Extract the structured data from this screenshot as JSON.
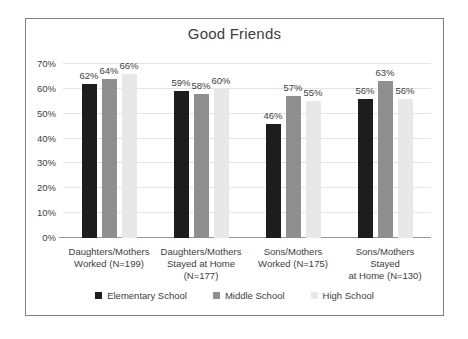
{
  "chart_data": {
    "type": "bar",
    "title": "Good Friends",
    "categories": [
      "Daughters/Mothers Worked (N=199)",
      "Daughters/Mothers Stayed at Home (N=177)",
      "Sons/Mothers Worked (N=175)",
      "Sons/Mothers Stayed at Home (N=130)"
    ],
    "category_lines": [
      [
        "Daughters/Mothers",
        "Worked (N=199)"
      ],
      [
        "Daughters/Mothers",
        "Stayed at Home",
        "(N=177)"
      ],
      [
        "Sons/Mothers",
        "Worked (N=175)"
      ],
      [
        "Sons/Mothers Stayed",
        "at Home (N=130)"
      ]
    ],
    "series": [
      {
        "name": "Elementary School",
        "color": "#1d1d1d",
        "values": [
          62,
          59,
          46,
          56
        ]
      },
      {
        "name": "Middle School",
        "color": "#8f8f8f",
        "values": [
          64,
          58,
          57,
          63
        ]
      },
      {
        "name": "High School",
        "color": "#e8e8e8",
        "values": [
          66,
          60,
          55,
          56
        ]
      }
    ],
    "data_label_suffix": "%",
    "ylim": [
      0,
      70
    ],
    "yticks": [
      "0%",
      "10%",
      "20%",
      "30%",
      "40%",
      "50%",
      "60%",
      "70%"
    ],
    "grid": true,
    "legend_position": "bottom",
    "colors": {
      "text": "#3d3d3d",
      "gridline": "#e4e4e4",
      "axis_line": "#999999",
      "frame_border": "#808080",
      "background": "#ffffff"
    }
  }
}
